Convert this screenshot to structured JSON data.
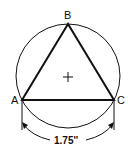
{
  "diagram": {
    "type": "inscribed-equilateral-triangle",
    "vertices": {
      "A": {
        "label": "A"
      },
      "B": {
        "label": "B"
      },
      "C": {
        "label": "C"
      }
    },
    "center_mark": "+",
    "dimension": {
      "label": "1.75''",
      "between": [
        "A",
        "C"
      ]
    },
    "colors": {
      "stroke": "#111111",
      "background": "#ffffff"
    }
  }
}
